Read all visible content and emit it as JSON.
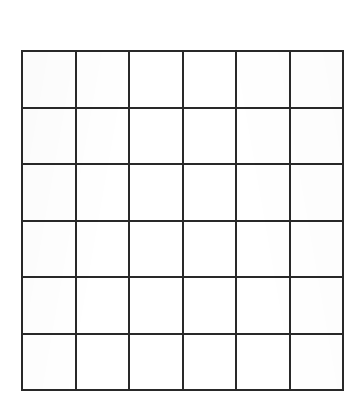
{
  "document": {
    "title": "Blank grid worksheet",
    "background_color": "#ffffff",
    "width": 364,
    "height": 408
  },
  "grid": {
    "name": "blank-6x6-grid",
    "columns": 6,
    "rows": 6,
    "line_color": "#2b2b2b",
    "line_width_px": 2,
    "cell_fill": "#ffffff",
    "bounds": {
      "left": 21,
      "top": 50,
      "width": 323,
      "height": 341
    },
    "cell_size": {
      "width": 54,
      "height": 57
    },
    "cells": [
      [
        "",
        "",
        "",
        "",
        "",
        ""
      ],
      [
        "",
        "",
        "",
        "",
        "",
        ""
      ],
      [
        "",
        "",
        "",
        "",
        "",
        ""
      ],
      [
        "",
        "",
        "",
        "",
        "",
        ""
      ],
      [
        "",
        "",
        "",
        "",
        "",
        ""
      ],
      [
        "",
        "",
        "",
        "",
        "",
        ""
      ]
    ]
  }
}
